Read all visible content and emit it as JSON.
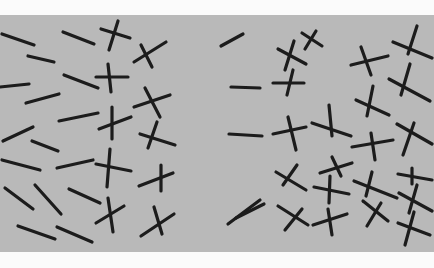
{
  "figure": {
    "width": 434,
    "height": 268,
    "page_background": "#fbfbfb",
    "panel": {
      "x": 0,
      "y": 15,
      "width": 434,
      "height": 237,
      "fill": "#b9b9b9"
    },
    "stroke_color": "#1c1c1c",
    "stroke_width": 3.2,
    "left_region": {
      "description": "mixed lines and crosses",
      "lines": [
        [
          2,
          34,
          34,
          45
        ],
        [
          63,
          32,
          94,
          44
        ],
        [
          28,
          56,
          54,
          62
        ],
        [
          64,
          75,
          98,
          88
        ],
        [
          0,
          87,
          29,
          84
        ],
        [
          26,
          103,
          59,
          94
        ],
        [
          59,
          121,
          98,
          113
        ],
        [
          3,
          141,
          33,
          127
        ],
        [
          32,
          141,
          58,
          151
        ],
        [
          2,
          160,
          40,
          170
        ],
        [
          57,
          168,
          93,
          160
        ],
        [
          5,
          188,
          33,
          209
        ],
        [
          35,
          185,
          61,
          214
        ],
        [
          69,
          189,
          100,
          203
        ],
        [
          18,
          226,
          55,
          239
        ],
        [
          57,
          227,
          92,
          242
        ]
      ],
      "crosses": [
        [
          [
            101,
            29,
            130,
            38
          ],
          [
            118,
            21,
            109,
            50
          ]
        ],
        [
          [
            134,
            62,
            166,
            42
          ],
          [
            141,
            45,
            152,
            67
          ]
        ],
        [
          [
            96,
            77,
            128,
            77
          ],
          [
            108,
            64,
            111,
            92
          ]
        ],
        [
          [
            134,
            107,
            170,
            95
          ],
          [
            145,
            88,
            160,
            117
          ]
        ],
        [
          [
            99,
            129,
            131,
            117
          ],
          [
            112,
            107,
            112,
            139
          ]
        ],
        [
          [
            140,
            134,
            175,
            145
          ],
          [
            157,
            122,
            148,
            148
          ]
        ],
        [
          [
            96,
            164,
            131,
            171
          ],
          [
            110,
            149,
            107,
            187
          ]
        ],
        [
          [
            139,
            186,
            173,
            173
          ],
          [
            161,
            165,
            161,
            191
          ]
        ],
        [
          [
            96,
            223,
            124,
            206
          ],
          [
            108,
            198,
            113,
            232
          ]
        ],
        [
          [
            141,
            236,
            174,
            214
          ],
          [
            154,
            207,
            162,
            234
          ]
        ]
      ]
    },
    "right_region": {
      "description": "mostly crosses with a few lines",
      "lines": [
        [
          221,
          46,
          243,
          34
        ],
        [
          231,
          87,
          260,
          88
        ],
        [
          229,
          134,
          262,
          136
        ],
        [
          228,
          224,
          260,
          200
        ],
        [
          236,
          218,
          264,
          204
        ]
      ],
      "crosses": [
        [
          [
            302,
            33,
            322,
            46
          ],
          [
            316,
            31,
            305,
            49
          ]
        ],
        [
          [
            278,
            49,
            306,
            64
          ],
          [
            294,
            41,
            285,
            70
          ]
        ],
        [
          [
            273,
            83,
            304,
            83
          ],
          [
            293,
            70,
            287,
            95
          ]
        ],
        [
          [
            351,
            65,
            388,
            56
          ],
          [
            361,
            47,
            371,
            75
          ]
        ],
        [
          [
            393,
            42,
            432,
            58
          ],
          [
            417,
            26,
            408,
            54
          ]
        ],
        [
          [
            389,
            79,
            430,
            101
          ],
          [
            410,
            64,
            401,
            95
          ]
        ],
        [
          [
            312,
            123,
            351,
            136
          ],
          [
            329,
            105,
            332,
            136
          ]
        ],
        [
          [
            356,
            100,
            389,
            115
          ],
          [
            373,
            86,
            367,
            116
          ]
        ],
        [
          [
            397,
            124,
            432,
            144
          ],
          [
            414,
            123,
            403,
            155
          ]
        ],
        [
          [
            273,
            134,
            306,
            127
          ],
          [
            288,
            117,
            296,
            150
          ]
        ],
        [
          [
            352,
            147,
            393,
            140
          ],
          [
            371,
            133,
            375,
            160
          ]
        ],
        [
          [
            276,
            172,
            306,
            190
          ],
          [
            297,
            165,
            283,
            185
          ]
        ],
        [
          [
            320,
            173,
            352,
            163
          ],
          [
            332,
            157,
            341,
            176
          ]
        ],
        [
          [
            314,
            187,
            349,
            194
          ],
          [
            330,
            176,
            329,
            203
          ]
        ],
        [
          [
            354,
            181,
            397,
            198
          ],
          [
            372,
            172,
            366,
            196
          ]
        ],
        [
          [
            398,
            174,
            432,
            180
          ],
          [
            412,
            168,
            412,
            184
          ]
        ],
        [
          [
            278,
            206,
            308,
            225
          ],
          [
            302,
            209,
            285,
            230
          ]
        ],
        [
          [
            313,
            225,
            347,
            214
          ],
          [
            328,
            209,
            332,
            235
          ]
        ],
        [
          [
            363,
            201,
            388,
            221
          ],
          [
            381,
            203,
            367,
            226
          ]
        ],
        [
          [
            399,
            193,
            432,
            211
          ],
          [
            417,
            185,
            409,
            213
          ]
        ],
        [
          [
            398,
            223,
            430,
            235
          ],
          [
            414,
            212,
            405,
            245
          ]
        ]
      ]
    }
  }
}
